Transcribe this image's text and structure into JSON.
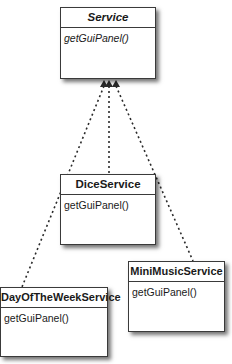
{
  "diagram": {
    "type": "uml-class-diagram",
    "interface": {
      "name": "Service",
      "abstract": true,
      "methods": [
        "getGuiPanel()"
      ]
    },
    "implementations": [
      {
        "name": "DiceService",
        "methods": [
          "getGuiPanel()"
        ]
      },
      {
        "name": "DayOfTheWeekService",
        "methods": [
          "getGuiPanel()"
        ]
      },
      {
        "name": "MiniMusicService",
        "methods": [
          "getGuiPanel()"
        ]
      }
    ],
    "relationship": "realization (dashed line, hollow-style arrowhead)",
    "colors": {
      "line": "#2a2a2a",
      "border": "#3a3a3a",
      "background": "#ffffff"
    }
  }
}
